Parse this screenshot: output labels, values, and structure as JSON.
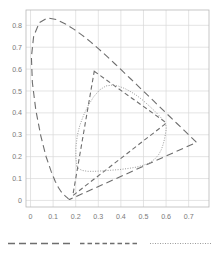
{
  "chart_data": {
    "type": "line",
    "title": "",
    "subtitle": "",
    "xlabel": "",
    "ylabel": "",
    "xlim": [
      -0.02,
      0.79
    ],
    "ylim": [
      -0.03,
      0.87
    ],
    "xticks": [
      0,
      0.1,
      0.2,
      0.3,
      0.4,
      0.5,
      0.6,
      0.7
    ],
    "yticks": [
      0,
      0.1,
      0.2,
      0.3,
      0.4,
      0.5,
      0.6,
      0.7,
      0.8
    ],
    "xticklabels": [
      "0",
      "0.1",
      "0.2",
      "0.3",
      "0.4",
      "0.5",
      "0.6",
      "0.7"
    ],
    "yticklabels": [
      "0",
      "0.1",
      "0.2",
      "0.3",
      "0.4",
      "0.5",
      "0.6",
      "0.7",
      "0.8"
    ],
    "grid": true,
    "legend_position": "below-axes",
    "grid_color": "#d9d9d9",
    "axis_color": "#b8b8b8",
    "tick_label_color": "#7a7a7a",
    "series": [
      {
        "name": "spectral-locus",
        "style": "long-dash",
        "color": "#6e6e6e",
        "linewidth": 1.1,
        "dasharray": "7,4",
        "closed": true,
        "points": [
          [
            0.1741,
            0.005
          ],
          [
            0.174,
            0.005
          ],
          [
            0.1738,
            0.0049
          ],
          [
            0.1736,
            0.0049
          ],
          [
            0.1733,
            0.0048
          ],
          [
            0.173,
            0.0048
          ],
          [
            0.1726,
            0.0048
          ],
          [
            0.1721,
            0.0048
          ],
          [
            0.1714,
            0.0051
          ],
          [
            0.1703,
            0.0058
          ],
          [
            0.1689,
            0.0069
          ],
          [
            0.1669,
            0.0086
          ],
          [
            0.1644,
            0.0109
          ],
          [
            0.1611,
            0.0138
          ],
          [
            0.1566,
            0.0177
          ],
          [
            0.151,
            0.0227
          ],
          [
            0.144,
            0.0297
          ],
          [
            0.1355,
            0.0399
          ],
          [
            0.1241,
            0.0578
          ],
          [
            0.1096,
            0.0868
          ],
          [
            0.0913,
            0.1327
          ],
          [
            0.0687,
            0.2007
          ],
          [
            0.0454,
            0.295
          ],
          [
            0.0235,
            0.4127
          ],
          [
            0.0082,
            0.5384
          ],
          [
            0.0039,
            0.6548
          ],
          [
            0.0139,
            0.7502
          ],
          [
            0.0389,
            0.812
          ],
          [
            0.0743,
            0.8338
          ],
          [
            0.1142,
            0.8262
          ],
          [
            0.1547,
            0.8059
          ],
          [
            0.1929,
            0.7816
          ],
          [
            0.2296,
            0.7543
          ],
          [
            0.2658,
            0.7243
          ],
          [
            0.3016,
            0.6923
          ],
          [
            0.3373,
            0.6589
          ],
          [
            0.3731,
            0.6245
          ],
          [
            0.4087,
            0.5896
          ],
          [
            0.4441,
            0.5547
          ],
          [
            0.4788,
            0.5202
          ],
          [
            0.5125,
            0.4866
          ],
          [
            0.5448,
            0.4544
          ],
          [
            0.5752,
            0.4242
          ],
          [
            0.6029,
            0.3965
          ],
          [
            0.627,
            0.3725
          ],
          [
            0.6482,
            0.3514
          ],
          [
            0.6658,
            0.334
          ],
          [
            0.6801,
            0.3197
          ],
          [
            0.6915,
            0.3083
          ],
          [
            0.7006,
            0.2993
          ],
          [
            0.7079,
            0.292
          ],
          [
            0.714,
            0.2859
          ],
          [
            0.719,
            0.2809
          ],
          [
            0.723,
            0.277
          ],
          [
            0.726,
            0.274
          ],
          [
            0.7283,
            0.2717
          ],
          [
            0.73,
            0.27
          ],
          [
            0.7311,
            0.2689
          ],
          [
            0.732,
            0.268
          ],
          [
            0.7327,
            0.2673
          ],
          [
            0.7334,
            0.2666
          ],
          [
            0.734,
            0.266
          ],
          [
            0.7344,
            0.2656
          ],
          [
            0.7346,
            0.2654
          ],
          [
            0.7347,
            0.2653
          ]
        ]
      },
      {
        "name": "wide-gamut-triangle",
        "style": "medium-dash",
        "color": "#6e6e6e",
        "linewidth": 1.1,
        "dasharray": "4.5,3",
        "closed": true,
        "points": [
          [
            0.282,
            0.59
          ],
          [
            0.602,
            0.354
          ],
          [
            0.187,
            0.022
          ],
          [
            0.282,
            0.59
          ]
        ]
      },
      {
        "name": "rounded-gamut",
        "style": "dotted",
        "color": "#9b9b9b",
        "linewidth": 1.0,
        "dasharray": "1,1.5",
        "closed": true,
        "points": [
          [
            0.2055,
            0.156
          ],
          [
            0.2005,
            0.196
          ],
          [
            0.201,
            0.246
          ],
          [
            0.207,
            0.296
          ],
          [
            0.218,
            0.342
          ],
          [
            0.234,
            0.387
          ],
          [
            0.254,
            0.431
          ],
          [
            0.279,
            0.473
          ],
          [
            0.306,
            0.505
          ],
          [
            0.334,
            0.523
          ],
          [
            0.362,
            0.527
          ],
          [
            0.39,
            0.522
          ],
          [
            0.418,
            0.511
          ],
          [
            0.445,
            0.496
          ],
          [
            0.472,
            0.478
          ],
          [
            0.498,
            0.457
          ],
          [
            0.523,
            0.434
          ],
          [
            0.547,
            0.411
          ],
          [
            0.568,
            0.389
          ],
          [
            0.585,
            0.369
          ],
          [
            0.596,
            0.352
          ],
          [
            0.601,
            0.338
          ],
          [
            0.6,
            0.322
          ],
          [
            0.597,
            0.302
          ],
          [
            0.593,
            0.28
          ],
          [
            0.587,
            0.256
          ],
          [
            0.579,
            0.232
          ],
          [
            0.567,
            0.209
          ],
          [
            0.55,
            0.189
          ],
          [
            0.528,
            0.173
          ],
          [
            0.5,
            0.161
          ],
          [
            0.468,
            0.152
          ],
          [
            0.432,
            0.146
          ],
          [
            0.394,
            0.141
          ],
          [
            0.356,
            0.138
          ],
          [
            0.318,
            0.135
          ],
          [
            0.283,
            0.133
          ],
          [
            0.253,
            0.133
          ],
          [
            0.229,
            0.137
          ],
          [
            0.213,
            0.145
          ],
          [
            0.2055,
            0.156
          ]
        ]
      }
    ],
    "legend_entries": [
      {
        "label": "",
        "style": "long-dash",
        "color": "#6e6e6e",
        "dasharray": "7,4"
      },
      {
        "label": "",
        "style": "medium-dash",
        "color": "#6e6e6e",
        "dasharray": "4.5,3"
      },
      {
        "label": "",
        "style": "dotted",
        "color": "#9b9b9b",
        "dasharray": "1,1.5"
      }
    ]
  },
  "figure": {
    "width": 219,
    "height": 257,
    "background": "#ffffff",
    "plot_left": 26,
    "plot_top": 10,
    "plot_right": 209,
    "plot_bottom": 207
  }
}
